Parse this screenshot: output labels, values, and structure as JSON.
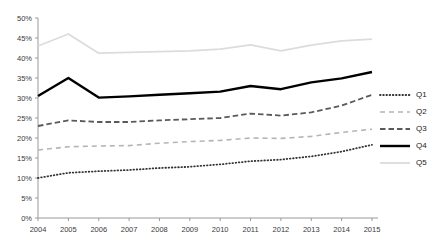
{
  "chart_data": {
    "type": "line",
    "title": "",
    "xlabel": "",
    "ylabel": "",
    "categories": [
      "2004",
      "2005",
      "2006",
      "2007",
      "2008",
      "2009",
      "2010",
      "2011",
      "2012",
      "2013",
      "2014",
      "2015"
    ],
    "x": [
      2004,
      2005,
      2006,
      2007,
      2008,
      2009,
      2010,
      2011,
      2012,
      2013,
      2014,
      2015
    ],
    "ylim": [
      0,
      50
    ],
    "yticks": [
      "0%",
      "5%",
      "10%",
      "15%",
      "20%",
      "25%",
      "30%",
      "35%",
      "40%",
      "45%",
      "50%"
    ],
    "ytick_values": [
      0,
      5,
      10,
      15,
      20,
      25,
      30,
      35,
      40,
      45,
      50
    ],
    "grid": false,
    "legend_position": "right",
    "series": [
      {
        "name": "Q1",
        "style": "dotted",
        "color": "#333333",
        "values": [
          10.0,
          11.3,
          11.7,
          12.0,
          12.5,
          12.8,
          13.4,
          14.2,
          14.6,
          15.4,
          16.6,
          18.3
        ]
      },
      {
        "name": "Q2",
        "style": "dashed-light",
        "color": "#b5b5b5",
        "values": [
          17.0,
          17.8,
          18.0,
          18.1,
          18.7,
          19.1,
          19.4,
          20.0,
          19.9,
          20.4,
          21.4,
          22.2
        ]
      },
      {
        "name": "Q3",
        "style": "dashed",
        "color": "#5a5a5a",
        "values": [
          23.0,
          24.4,
          24.0,
          24.0,
          24.4,
          24.7,
          25.0,
          26.1,
          25.6,
          26.4,
          28.1,
          30.8
        ]
      },
      {
        "name": "Q4",
        "style": "solid-bold",
        "color": "#000000",
        "values": [
          30.5,
          35.0,
          30.1,
          30.4,
          30.8,
          31.2,
          31.6,
          33.0,
          32.2,
          33.9,
          34.9,
          36.5
        ]
      },
      {
        "name": "Q5",
        "style": "solid-light",
        "color": "#dcdcdc",
        "values": [
          43.0,
          46.0,
          41.2,
          41.4,
          41.6,
          41.8,
          42.2,
          43.3,
          41.8,
          43.2,
          44.3,
          44.7
        ]
      }
    ]
  },
  "legend": {
    "items": [
      {
        "label": "Q1"
      },
      {
        "label": "Q2"
      },
      {
        "label": "Q3"
      },
      {
        "label": "Q4"
      },
      {
        "label": "Q5"
      }
    ]
  }
}
